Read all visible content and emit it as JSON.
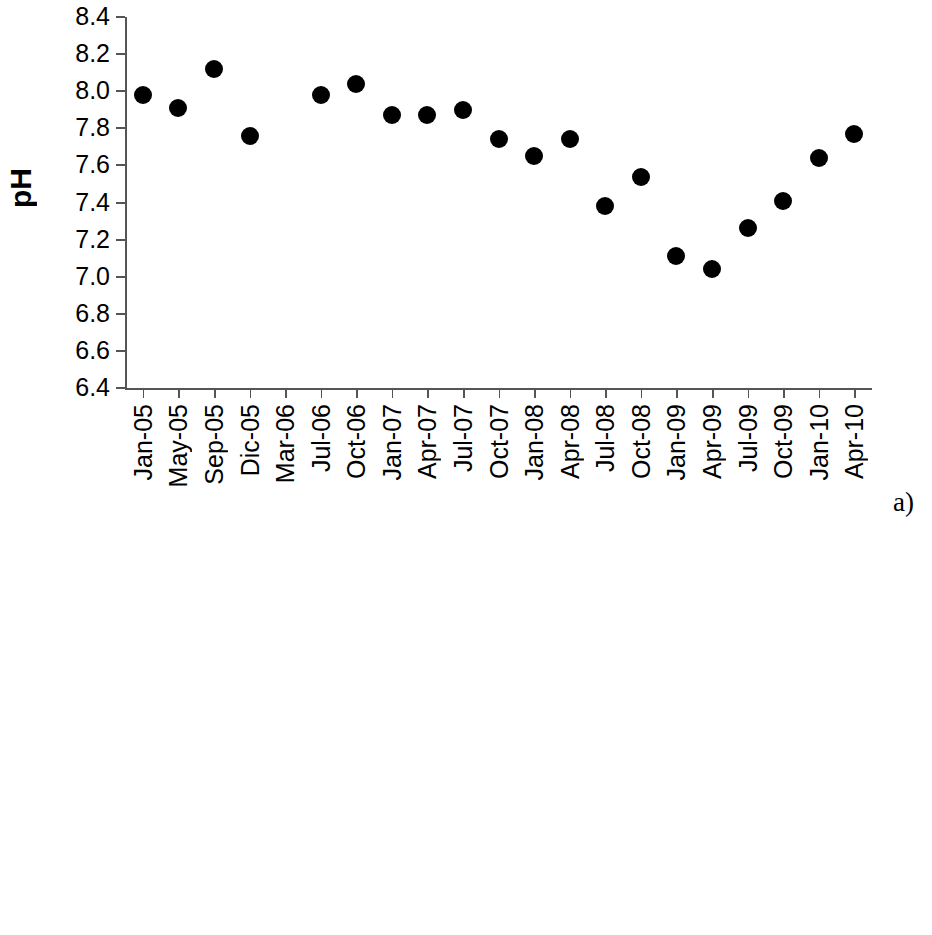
{
  "figure": {
    "panel_a_tag": "a)",
    "panel_b_tag": "b"
  },
  "chart_data": [
    {
      "type": "scatter",
      "title": "",
      "xlabel": "",
      "ylabel": "pH",
      "ylim": [
        6.4,
        8.4
      ],
      "ytick_step": 0.2,
      "yticks": [
        "8.4",
        "8.2",
        "8.0",
        "7.8",
        "7.6",
        "7.4",
        "7.2",
        "7.0",
        "6.8",
        "6.6",
        "6.4"
      ],
      "grid": false,
      "legend": "none",
      "categories": [
        "Jan-05",
        "May-05",
        "Sep-05",
        "Dic-05",
        "Mar-06",
        "Jul-06",
        "Oct-06",
        "Jan-07",
        "Apr-07",
        "Jul-07",
        "Oct-07",
        "Jan-08",
        "Apr-08",
        "Jul-08",
        "Oct-08",
        "Jan-09",
        "Apr-09",
        "Jul-09",
        "Oct-09",
        "Jan-10",
        "Apr-10"
      ],
      "values": [
        7.98,
        7.91,
        8.12,
        7.76,
        null,
        7.98,
        8.04,
        7.87,
        7.87,
        7.9,
        7.74,
        7.65,
        7.74,
        7.38,
        7.54,
        7.11,
        7.04,
        7.26,
        7.41,
        7.64,
        7.77
      ]
    },
    {
      "type": "box",
      "title": "",
      "xlabel": "",
      "ylabel": "DO%",
      "ylim": [
        0,
        140
      ],
      "ytick_step": 20,
      "yticks": [
        "140",
        "120",
        "100",
        "80",
        "60",
        "40",
        "20",
        "0"
      ],
      "grid": false,
      "legend": "none",
      "categories": [
        "May-05",
        "Sep-05",
        "Dic-05",
        "Mar-06",
        "Jul-06",
        "Oct-06",
        "Jan-07",
        "Apr-07",
        "Jul-07",
        "Oct-07",
        "Jan-08",
        "Apr-08",
        "Jul-08",
        "Oct-08",
        "Jan-09",
        "Apr-09",
        "Jul-09",
        "Oct-09",
        "Jan-10",
        "Apr-10",
        "Oct-10"
      ],
      "boxes": [
        {
          "label": "May-05",
          "min": 23,
          "q1": 45,
          "median": 63,
          "q3": 75,
          "max": 97
        },
        {
          "label": "Sep-05",
          "min": 5,
          "q1": 30,
          "median": 42,
          "q3": 62,
          "max": 97
        },
        {
          "label": "Dic-05",
          "min": 32,
          "q1": 57,
          "median": 61,
          "q3": 68,
          "max": 73
        },
        {
          "label": "Mar-06",
          "min": 32,
          "q1": 43,
          "median": 45,
          "q3": 48,
          "max": 52
        },
        {
          "label": "Jul-06",
          "min": 35,
          "q1": 58,
          "median": 69,
          "q3": 83,
          "max": 108
        },
        {
          "label": "Oct-06",
          "min": 22,
          "q1": 60,
          "median": 66,
          "q3": 74,
          "max": 90
        },
        {
          "label": "Jan-07",
          "min": 23,
          "q1": 58,
          "median": 68,
          "q3": 80,
          "max": 103
        },
        {
          "label": "Apr-07",
          "min": 42,
          "q1": 60,
          "median": 70,
          "q3": 82,
          "max": 108
        },
        {
          "label": "Jul-07",
          "min": 25,
          "q1": 63,
          "median": 72,
          "q3": 80,
          "max": 103
        },
        {
          "label": "Oct-07",
          "min": 17,
          "q1": 55,
          "median": 59,
          "q3": 68,
          "max": 88
        },
        {
          "label": "Jan-08",
          "min": 33,
          "q1": 61,
          "median": 68,
          "q3": 75,
          "max": 88
        },
        {
          "label": "Apr-08",
          "min": 9,
          "q1": 66,
          "median": 72,
          "q3": 77,
          "max": 88
        },
        {
          "label": "Jul-08",
          "min": 46,
          "q1": 72,
          "median": 78,
          "q3": 87,
          "max": 97
        },
        {
          "label": "Oct-08",
          "min": 23,
          "q1": 35,
          "median": 39,
          "q3": 45,
          "max": 73
        },
        {
          "label": "Jan-09",
          "min": 67,
          "q1": 78,
          "median": 110,
          "q3": 110,
          "max": 117
        },
        {
          "label": "Apr-09",
          "min": 61,
          "q1": 70,
          "median": 90,
          "q3": 104,
          "max": 112
        },
        {
          "label": "Jul-09",
          "min": 19,
          "q1": 43,
          "median": 43,
          "q3": 83,
          "max": 110
        },
        {
          "label": "Oct-09",
          "min": 34,
          "q1": 38,
          "median": 40,
          "q3": 47,
          "max": 110
        },
        {
          "label": "Jan-10",
          "min": 48,
          "q1": 78,
          "median": 82,
          "q3": 87,
          "max": 98
        },
        {
          "label": "Apr-10",
          "min": 58,
          "q1": 75,
          "median": 77,
          "q3": 82,
          "max": 92
        },
        {
          "label": "Oct-10",
          "min": 27,
          "q1": 80,
          "median": 86,
          "q3": 92,
          "max": 97
        }
      ]
    }
  ]
}
